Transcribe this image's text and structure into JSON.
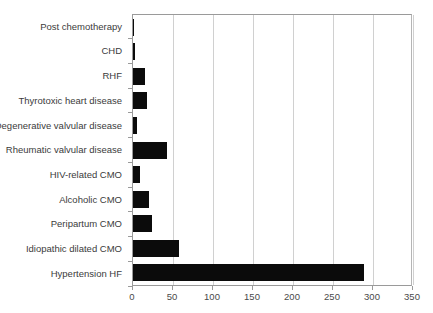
{
  "chart_data": {
    "type": "bar",
    "orientation": "horizontal",
    "title": "",
    "subtitle": "",
    "xlabel": "",
    "ylabel": "",
    "xlim": [
      0,
      350
    ],
    "xticks": [
      0,
      50,
      100,
      150,
      200,
      250,
      300,
      350
    ],
    "xtick_labels": [
      "0",
      "50",
      "100",
      "150",
      "200",
      "250",
      "300",
      "350"
    ],
    "grid": true,
    "grid_axis": "x",
    "legend": false,
    "legend_position": "none",
    "bar_color": "#0b0b0b",
    "categories": [
      "Post chemotherapy",
      "CHD",
      "RHF",
      "Thyrotoxic heart disease",
      "Degenerative valvular disease",
      "Rheumatic valvular disease",
      "HIV-related CMO",
      "Alcoholic CMO",
      "Peripartum CMO",
      "Idiopathic dilated CMO",
      "Hypertension HF"
    ],
    "values": [
      1,
      2,
      15,
      17,
      5,
      42,
      9,
      20,
      24,
      58,
      289
    ]
  }
}
